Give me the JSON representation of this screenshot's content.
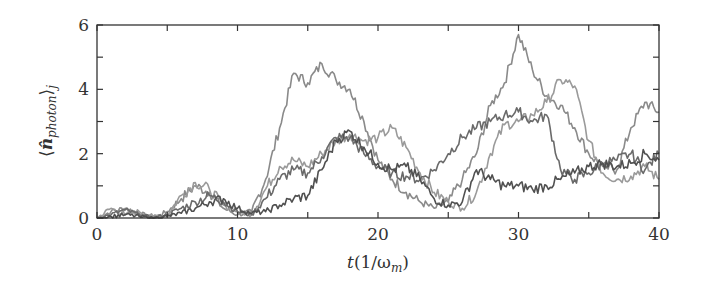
{
  "chart_data": {
    "type": "line",
    "title": "",
    "xlabel": "t(1/ω_m)",
    "ylabel": "⟨n̂_photon⟩_j",
    "xlim": [
      0,
      40
    ],
    "ylim": [
      0,
      6
    ],
    "x_ticks": [
      0,
      10,
      20,
      30,
      40
    ],
    "x_minor_ticks": [
      5,
      15,
      25,
      35
    ],
    "y_ticks": [
      0,
      2,
      4,
      6
    ],
    "y_minor_ticks": [
      1,
      3,
      5
    ],
    "grid": false,
    "legend": null,
    "x": [
      0,
      1,
      2,
      3,
      4,
      5,
      6,
      7,
      8,
      9,
      10,
      11,
      12,
      13,
      14,
      15,
      16,
      17,
      18,
      19,
      20,
      21,
      22,
      23,
      24,
      25,
      26,
      27,
      28,
      29,
      30,
      31,
      32,
      33,
      34,
      35,
      36,
      37,
      38,
      39,
      40
    ],
    "series": [
      {
        "name": "trajectory-1",
        "color": "#8a8a8a",
        "values": [
          0,
          0.2,
          0.3,
          0.15,
          0,
          0.2,
          0.6,
          1.0,
          0.8,
          0.3,
          0.1,
          0.2,
          1.2,
          2.8,
          4.5,
          4.2,
          4.8,
          4.3,
          4.0,
          3.0,
          1.8,
          1.2,
          0.8,
          0.5,
          0.3,
          0.5,
          1.2,
          2.0,
          3.5,
          4.2,
          5.7,
          4.6,
          3.8,
          3.5,
          2.8,
          2.0,
          1.6,
          1.5,
          2.8,
          3.6,
          3.3
        ]
      },
      {
        "name": "trajectory-2",
        "color": "#9a9a9a",
        "values": [
          0,
          0.3,
          0.1,
          0.2,
          0.05,
          0.1,
          0.7,
          1.1,
          0.9,
          0.4,
          0.2,
          0.1,
          0.9,
          1.6,
          1.8,
          1.6,
          2.0,
          2.4,
          2.6,
          2.4,
          2.5,
          2.8,
          2.2,
          1.4,
          0.8,
          0.5,
          0.3,
          0.8,
          2.0,
          2.9,
          3.0,
          3.2,
          3.6,
          4.3,
          4.1,
          2.4,
          1.4,
          1.2,
          1.3,
          1.6,
          1.2
        ]
      },
      {
        "name": "trajectory-3",
        "color": "#6a6a6a",
        "values": [
          0,
          0.1,
          0.25,
          0.1,
          0,
          0.1,
          0.3,
          0.5,
          0.7,
          0.5,
          0.2,
          0.1,
          0.6,
          1.2,
          1.5,
          1.4,
          1.9,
          2.5,
          2.5,
          2.0,
          1.6,
          1.4,
          1.3,
          1.2,
          1.5,
          2.0,
          2.5,
          2.8,
          3.0,
          3.2,
          3.3,
          3.0,
          3.2,
          1.5,
          1.2,
          1.4,
          1.7,
          1.8,
          2.0,
          1.5,
          2.0
        ]
      },
      {
        "name": "trajectory-4",
        "color": "#505050",
        "values": [
          0,
          0.05,
          0.1,
          0.05,
          0,
          0.05,
          0.15,
          0.3,
          0.5,
          0.6,
          0.3,
          0.15,
          0.2,
          0.4,
          0.6,
          0.7,
          1.5,
          2.4,
          2.7,
          2.2,
          1.7,
          1.5,
          1.6,
          1.2,
          0.6,
          0.4,
          0.5,
          1.5,
          1.2,
          1.0,
          1.0,
          0.9,
          1.0,
          1.2,
          1.4,
          1.6,
          1.7,
          1.6,
          1.7,
          2.0,
          1.8
        ]
      }
    ]
  },
  "axes": {
    "x_tick_labels": [
      "0",
      "10",
      "20",
      "30",
      "40"
    ],
    "y_tick_labels": [
      "0",
      "2",
      "4",
      "6"
    ],
    "xlabel_main": "t",
    "xlabel_paren": "(1/ω",
    "xlabel_sub": "m",
    "xlabel_close": ")",
    "ylabel_open": "⟨",
    "ylabel_main": "n̂",
    "ylabel_sub": "photon",
    "ylabel_close": "⟩",
    "ylabel_subj": "j"
  }
}
